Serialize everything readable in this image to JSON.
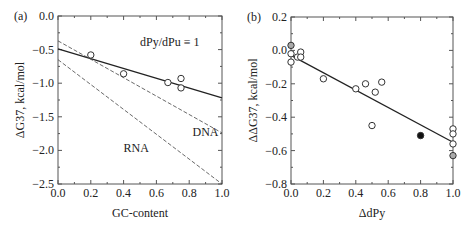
{
  "chart_data": [
    {
      "panel": "(a)",
      "type": "scatter",
      "xlabel": "GC-content",
      "ylabel": "ΔG37, kcal/mol",
      "xlim": [
        0.0,
        1.0
      ],
      "ylim": [
        -2.5,
        0.0
      ],
      "xticks": [
        "0.0",
        "0.2",
        "0.4",
        "0.6",
        "0.8",
        "1.0"
      ],
      "yticks": [
        "0.0",
        "−0.5",
        "−1.0",
        "−1.5",
        "−2.0",
        "−2.5"
      ],
      "annotation": "dPy/dPu ≡ 1",
      "grid": false,
      "points": [
        {
          "x": 0.2,
          "y": -0.58
        },
        {
          "x": 0.4,
          "y": -0.86
        },
        {
          "x": 0.67,
          "y": -0.99
        },
        {
          "x": 0.75,
          "y": -0.93
        },
        {
          "x": 0.75,
          "y": -1.07
        }
      ],
      "lines": [
        {
          "name": "fit",
          "style": "solid",
          "x": [
            0,
            1
          ],
          "y": [
            -0.49,
            -1.22
          ]
        },
        {
          "name": "DNA",
          "style": "dashed",
          "x": [
            0,
            1
          ],
          "y": [
            -0.37,
            -1.74
          ]
        },
        {
          "name": "RNA",
          "style": "dashed",
          "x": [
            0,
            1
          ],
          "y": [
            -0.65,
            -2.5
          ]
        }
      ],
      "line_labels": [
        {
          "text": "DNA",
          "x": 0.82,
          "y": -1.72
        },
        {
          "text": "RNA",
          "x": 0.4,
          "y": -1.97
        }
      ]
    },
    {
      "panel": "(b)",
      "type": "scatter",
      "xlabel": "ΔdPy",
      "ylabel": "ΔΔG37, kcal/mol",
      "xlim": [
        0.0,
        1.0
      ],
      "ylim": [
        -0.8,
        0.2
      ],
      "xticks": [
        "0.0",
        "0.2",
        "0.4",
        "0.6",
        "0.8",
        "1.0"
      ],
      "yticks": [
        "0.2",
        "0.0",
        "−0.2",
        "−0.4",
        "−0.6",
        "−0.8"
      ],
      "grid": false,
      "points": [
        {
          "x": 0.0,
          "y": 0.03,
          "fill": "grey"
        },
        {
          "x": 0.0,
          "y": -0.02,
          "fill": "open"
        },
        {
          "x": 0.0,
          "y": -0.07,
          "fill": "open"
        },
        {
          "x": 0.04,
          "y": -0.04,
          "fill": "open"
        },
        {
          "x": 0.06,
          "y": -0.01,
          "fill": "open"
        },
        {
          "x": 0.06,
          "y": -0.04,
          "fill": "open"
        },
        {
          "x": 0.2,
          "y": -0.17,
          "fill": "open"
        },
        {
          "x": 0.4,
          "y": -0.23,
          "fill": "open"
        },
        {
          "x": 0.46,
          "y": -0.2,
          "fill": "open"
        },
        {
          "x": 0.52,
          "y": -0.25,
          "fill": "open"
        },
        {
          "x": 0.56,
          "y": -0.19,
          "fill": "open"
        },
        {
          "x": 0.5,
          "y": -0.45,
          "fill": "open"
        },
        {
          "x": 0.8,
          "y": -0.51,
          "fill": "black"
        },
        {
          "x": 1.0,
          "y": -0.47,
          "fill": "open"
        },
        {
          "x": 1.0,
          "y": -0.5,
          "fill": "open"
        },
        {
          "x": 1.0,
          "y": -0.56,
          "fill": "open"
        },
        {
          "x": 1.0,
          "y": -0.63,
          "fill": "grey"
        }
      ],
      "lines": [
        {
          "name": "fit",
          "style": "solid",
          "x": [
            0,
            1
          ],
          "y": [
            -0.03,
            -0.55
          ]
        }
      ]
    }
  ]
}
